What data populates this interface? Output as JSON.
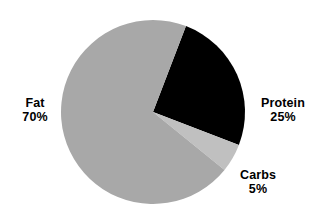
{
  "chart_data": {
    "type": "pie",
    "title": "",
    "subtitle": "",
    "xlabel": "",
    "ylabel": "",
    "grid": false,
    "legend_position": "none",
    "label_style": "outside-callout-text",
    "background_color": "#ffffff",
    "text_color": "#000000",
    "center": {
      "x": 153,
      "y": 112
    },
    "radius": 92,
    "start_angle_deg": 21,
    "direction": "clockwise",
    "categories": [
      "Protein",
      "Carbs",
      "Fat"
    ],
    "values": [
      25,
      5,
      70
    ],
    "value_unit": "%",
    "colors": [
      "#000000",
      "#c0c0c0",
      "#a8a8a8"
    ],
    "slices": [
      {
        "name": "Protein",
        "value": 25,
        "value_label": "25%",
        "color": "#000000",
        "start_angle_deg": 21,
        "sweep_deg": 90
      },
      {
        "name": "Carbs",
        "value": 5,
        "value_label": "5%",
        "color": "#c0c0c0",
        "start_angle_deg": 111,
        "sweep_deg": 18
      },
      {
        "name": "Fat",
        "value": 70,
        "value_label": "70%",
        "color": "#a8a8a8",
        "start_angle_deg": 129,
        "sweep_deg": 252
      }
    ]
  },
  "labels": {
    "fat": {
      "name": "Fat",
      "value": "70%"
    },
    "protein": {
      "name": "Protein",
      "value": "25%"
    },
    "carbs": {
      "name": "Carbs",
      "value": "5%"
    }
  }
}
